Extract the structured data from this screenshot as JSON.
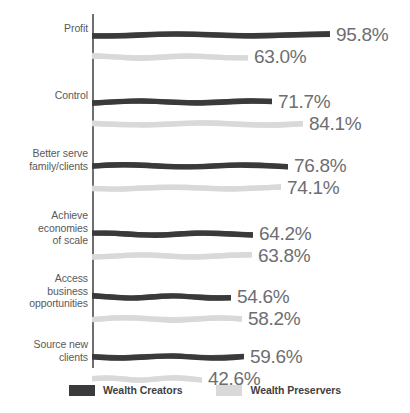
{
  "chart_data": {
    "type": "bar",
    "orientation": "horizontal",
    "title": "",
    "subtitle": "",
    "xlabel": "",
    "ylabel": "",
    "grid": false,
    "axis": {
      "visible_axis": "category",
      "tick_labels": []
    },
    "legend": {
      "position": "bottom-center",
      "entries": [
        {
          "name": "Wealth Creators",
          "color": "#3a3a3c"
        },
        {
          "name": "Wealth Preservers",
          "color": "#d9d9d9"
        }
      ]
    },
    "categories": [
      "Profit",
      "Control",
      "Better serve family/clients",
      "Achieve economies of scale",
      "Access business opportunities",
      "Source new clients"
    ],
    "category_lines": [
      [
        "Profit"
      ],
      [
        "Control"
      ],
      [
        "Better serve",
        "family/clients"
      ],
      [
        "Achieve",
        "economies",
        "of scale"
      ],
      [
        "Access",
        "business",
        "opportunities"
      ],
      [
        "Source new",
        "clients"
      ]
    ],
    "series": [
      {
        "name": "Wealth Creators",
        "color": "#3a3a3c",
        "values": [
          95.8,
          71.7,
          76.8,
          64.2,
          54.6,
          59.6
        ],
        "labels": [
          "95.8%",
          "71.7%",
          "76.8%",
          "64.2%",
          "54.6%",
          "59.6%"
        ],
        "bar_px": [
          238,
          180,
          196,
          161,
          139,
          152
        ]
      },
      {
        "name": "Wealth Preservers",
        "color": "#d9d9d9",
        "values": [
          63.0,
          84.1,
          74.1,
          63.8,
          58.2,
          42.6
        ],
        "labels": [
          "63.0%",
          "84.1%",
          "74.1%",
          "63.8%",
          "58.2%",
          "42.6%"
        ],
        "bar_px": [
          156,
          211,
          189,
          160,
          150,
          110
        ]
      }
    ]
  },
  "colors": {
    "dark_series": "#3a3a3c",
    "light_series": "#d9d9d9",
    "axis": "#6e6f71",
    "label_text": "#58595b",
    "value_text": "#6d6e71",
    "legend_text": "#3f4042",
    "background": "#ffffff"
  }
}
